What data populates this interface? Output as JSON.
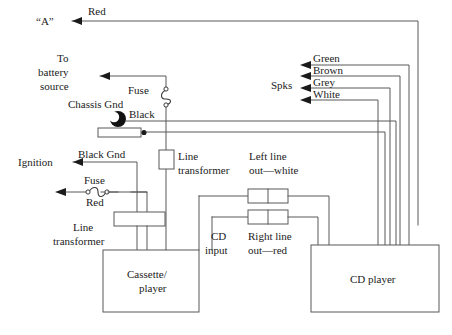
{
  "diagram": {
    "colors": {
      "wire": "#59595b",
      "wire_light": "#8a8a8c",
      "ink": "#1b1b1b",
      "ground_fill": "#111111",
      "page": "#ffffff"
    },
    "labels": {
      "a_terminal": "“A”",
      "red_top": "Red",
      "to_battery_line1": "To",
      "to_battery_line2": "battery",
      "to_battery_line3": "source",
      "fuse_top": "Fuse",
      "chassis_gnd": "Chassis Gnd",
      "black": "Black",
      "ignition": "Ignition",
      "black_gnd": "Black Gnd",
      "fuse_left": "Fuse",
      "red_left": "Red",
      "line_transformer_left_line1": "Line",
      "line_transformer_left_line2": "transformer",
      "line_transformer_mid_line1": "Line",
      "line_transformer_mid_line2": "transformer",
      "spks": "Spks",
      "spk_green": "Green",
      "spk_brown": "Brown",
      "spk_grey": "Grey",
      "spk_white": "White",
      "left_line_out_line1": "Left line",
      "left_line_out_line2": "out—white",
      "right_line_out_line1": "Right line",
      "right_line_out_line2": "out—red",
      "cd_input_line1": "CD",
      "cd_input_line2": "input",
      "cassette_player_line1": "Cassette/",
      "cassette_player_line2": "player",
      "cd_player": "CD player"
    },
    "components": [
      {
        "name": "cassette-player",
        "label": "Cassette/ player"
      },
      {
        "name": "cd-player",
        "label": "CD player"
      },
      {
        "name": "line-transformer-vertical",
        "label": "Line transformer"
      },
      {
        "name": "line-transformer-horizontal",
        "label": "Line transformer"
      },
      {
        "name": "fuse-battery",
        "label": "Fuse"
      },
      {
        "name": "fuse-ignition",
        "label": "Fuse"
      },
      {
        "name": "chassis-ground",
        "label": "Chassis Gnd"
      },
      {
        "name": "rca-left-line-out",
        "label": "Left line out—white"
      },
      {
        "name": "rca-right-line-out",
        "label": "Right line out—red"
      }
    ],
    "speaker_wires": [
      "Green",
      "Brown",
      "Grey",
      "White"
    ]
  }
}
